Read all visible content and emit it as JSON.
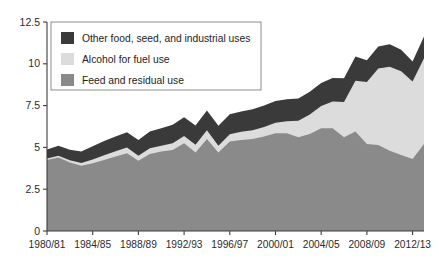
{
  "chart_data": {
    "type": "area",
    "stacked": true,
    "title": "",
    "subtitle": "",
    "xlabel": "",
    "ylabel": "",
    "grid": false,
    "legend_position": "top-left",
    "ylim": [
      0,
      12.5
    ],
    "yticks": [
      "0",
      "2.5",
      "5",
      "7.5",
      "10",
      "12.5"
    ],
    "ytick_values": [
      0,
      2.5,
      5,
      7.5,
      10,
      12.5
    ],
    "xticks": [
      "1980/81",
      "1984/85",
      "1988/89",
      "1992/93",
      "1996/97",
      "2000/01",
      "2004/05",
      "2008/09",
      "2012/13"
    ],
    "xtick_indices": [
      0,
      4,
      8,
      12,
      16,
      20,
      24,
      28,
      32
    ],
    "categories": [
      "1980/81",
      "1981/82",
      "1982/83",
      "1983/84",
      "1984/85",
      "1985/86",
      "1986/87",
      "1987/88",
      "1988/89",
      "1989/90",
      "1990/91",
      "1991/92",
      "1992/93",
      "1993/94",
      "1994/95",
      "1995/96",
      "1996/97",
      "1997/98",
      "1998/99",
      "1999/00",
      "2000/01",
      "2001/02",
      "2002/03",
      "2003/04",
      "2004/05",
      "2005/06",
      "2006/07",
      "2007/08",
      "2008/09",
      "2009/10",
      "2010/11",
      "2011/12",
      "2012/13",
      "2013/14"
    ],
    "series": [
      {
        "name": "Feed and residual use",
        "color": "#8a8a8a",
        "values": [
          4.25,
          4.4,
          4.1,
          3.9,
          4.05,
          4.25,
          4.45,
          4.65,
          4.2,
          4.6,
          4.75,
          4.85,
          5.25,
          4.7,
          5.5,
          4.7,
          5.35,
          5.45,
          5.5,
          5.65,
          5.85,
          5.85,
          5.6,
          5.8,
          6.15,
          6.15,
          5.6,
          5.95,
          5.2,
          5.15,
          4.8,
          4.55,
          4.3,
          5.2
        ]
      },
      {
        "name": "Alcohol for fuel use",
        "color": "#dcdcdc",
        "values": [
          0.08,
          0.1,
          0.13,
          0.17,
          0.22,
          0.28,
          0.32,
          0.35,
          0.3,
          0.35,
          0.35,
          0.4,
          0.43,
          0.46,
          0.53,
          0.4,
          0.43,
          0.48,
          0.53,
          0.57,
          0.62,
          0.71,
          0.99,
          1.17,
          1.32,
          1.6,
          2.12,
          3.03,
          3.71,
          4.57,
          5.02,
          5.01,
          4.64,
          5.13
        ]
      },
      {
        "name": "Other food, seed, and industrial uses",
        "color": "#3a3a3a",
        "values": [
          0.55,
          0.6,
          0.63,
          0.68,
          0.8,
          0.85,
          0.88,
          0.9,
          0.95,
          1.0,
          1.05,
          1.1,
          1.12,
          1.15,
          1.18,
          1.2,
          1.2,
          1.22,
          1.25,
          1.28,
          1.3,
          1.32,
          1.34,
          1.36,
          1.38,
          1.4,
          1.42,
          1.45,
          1.3,
          1.32,
          1.35,
          1.28,
          1.2,
          1.3
        ]
      }
    ]
  },
  "legend": {
    "items": [
      {
        "label": "Other food, seed, and industrial uses",
        "color": "#3a3a3a"
      },
      {
        "label": "Alcohol for fuel use",
        "color": "#dcdcdc"
      },
      {
        "label": "Feed and residual use",
        "color": "#8a8a8a"
      }
    ]
  }
}
